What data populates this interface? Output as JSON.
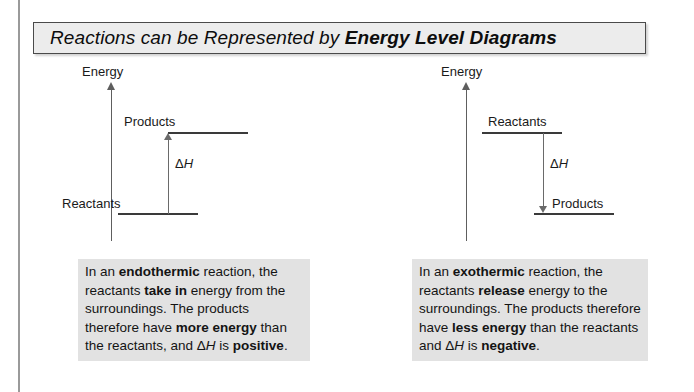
{
  "title": {
    "plain_prefix": "Reactions can be Represented by ",
    "bold_suffix": "Energy Level Diagrams"
  },
  "diagrams": [
    {
      "id": "endothermic",
      "axis_label": "Energy",
      "upper_level_label": "Products",
      "lower_level_label": "Reactants",
      "delta_symbol": "Δ",
      "delta_variable": "H",
      "arrow_direction": "up"
    },
    {
      "id": "exothermic",
      "axis_label": "Energy",
      "upper_level_label": "Reactants",
      "lower_level_label": "Products",
      "delta_symbol": "Δ",
      "delta_variable": "H",
      "arrow_direction": "down"
    }
  ],
  "captions": {
    "endothermic": {
      "s1": "In an ",
      "b1": "endothermic",
      "s2": " reaction, the reactants ",
      "b2": "take in",
      "s3": " energy from the surroundings.  The products therefore have ",
      "b3": "more energy",
      "s4": " than the reactants, and Δ",
      "i1": "H",
      "s5": " is ",
      "b4": "positive",
      "s6": "."
    },
    "exothermic": {
      "s1": "In an ",
      "b1": "exothermic",
      "s2": " reaction, the reactants ",
      "b2": "release",
      "s3": " energy to the surroundings.  The products therefore have ",
      "b3": "less energy",
      "s4": " than the reactants and Δ",
      "i1": "H",
      "s5": " is ",
      "b4": "negative",
      "s6": "."
    }
  },
  "colors": {
    "title_fill": "#ececec",
    "title_border": "#4a4a4a",
    "caption_fill": "#e2e2e2",
    "line": "#3a3a3a",
    "arrow": "#6a6a6a"
  }
}
